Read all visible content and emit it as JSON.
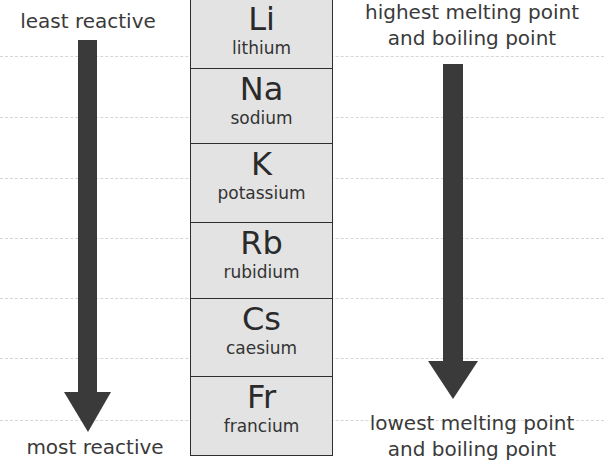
{
  "left_axis": {
    "top_label": "least reactive",
    "bottom_label": "most reactive"
  },
  "right_axis": {
    "top_label_line1": "highest melting point",
    "top_label_line2": "and boiling point",
    "bottom_label_line1": "lowest melting point",
    "bottom_label_line2": "and boiling point"
  },
  "elements": [
    {
      "symbol": "Li",
      "name": "lithium"
    },
    {
      "symbol": "Na",
      "name": "sodium"
    },
    {
      "symbol": "K",
      "name": "potassium"
    },
    {
      "symbol": "Rb",
      "name": "rubidium"
    },
    {
      "symbol": "Cs",
      "name": "caesium"
    },
    {
      "symbol": "Fr",
      "name": "francium"
    }
  ],
  "colors": {
    "box_fill": "#e3e3e3",
    "arrow": "#3a3a3a",
    "text": "#333333"
  }
}
